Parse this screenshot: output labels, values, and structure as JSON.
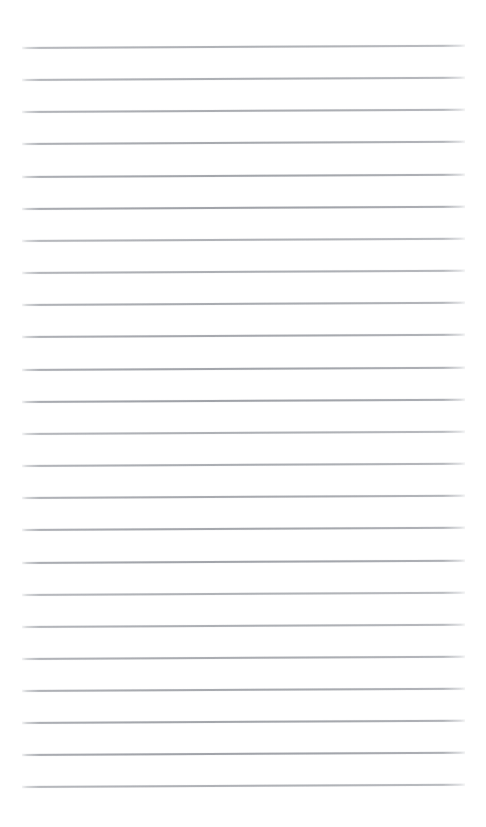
{
  "page": {
    "kind": "scanned-blank-ruled-notepad-page",
    "width": 486,
    "height": 827,
    "background_color": "#ffffff",
    "text_content": "",
    "handwriting_present": false,
    "printed_text_present": false
  },
  "rules": {
    "description": "Faint horizontal ruled lines of a blank notepad page",
    "count": 24,
    "color": "#9a9da3",
    "thickness_px": 2,
    "left_px": 22,
    "right_px": 465,
    "length_px": 443,
    "first_line_y_px": 47,
    "spacing_px": 32.1,
    "slant_deg": -0.3,
    "y_positions": [
      47,
      79,
      111,
      143,
      176,
      208,
      240,
      272,
      304,
      336,
      369,
      401,
      433,
      465,
      497,
      529,
      562,
      594,
      626,
      658,
      690,
      722,
      754,
      786
    ]
  },
  "margins": {
    "top_px": 47,
    "bottom_px": 41,
    "left_px": 22,
    "right_px": 21
  }
}
